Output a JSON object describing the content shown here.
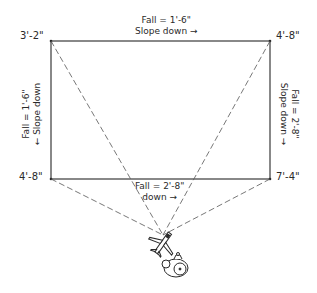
{
  "diagram": {
    "type": "roof-slope-plan",
    "corners": {
      "top_left": "3'-2\"",
      "top_right": "4'-8\"",
      "bottom_left": "4'-8\"",
      "bottom_right": "7'-4\""
    },
    "edges": {
      "top": {
        "fall": "Fall = 1'-6\"",
        "direction": "Slope down",
        "arrow": "→"
      },
      "left": {
        "fall": "Fall = 1'-6\"",
        "direction": "Slope down",
        "arrow": "→"
      },
      "right": {
        "fall": "Fall = 2'-8\"",
        "direction": "Slope down",
        "arrow": "→"
      },
      "bottom": {
        "fall": "Fall = 2'-8\"",
        "direction": "down",
        "arrow": "→"
      }
    },
    "viewpoint": {
      "icons": [
        "airplane-icon",
        "camera-icon"
      ]
    },
    "colors": {
      "line": "#3a3a3a",
      "dashed": "#555555",
      "background": "#ffffff"
    }
  }
}
